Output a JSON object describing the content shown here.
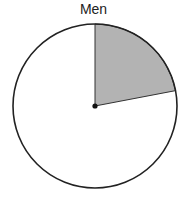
{
  "chart_data": {
    "type": "pie",
    "title": "Men",
    "categories": [
      "Shaded",
      "Unshaded"
    ],
    "values": [
      22,
      78
    ],
    "start_angle_deg": 0,
    "direction": "clockwise",
    "colors": {
      "shaded": "#b3b3b3",
      "unshaded": "#ffffff",
      "outline": "#222222"
    },
    "legend": "none",
    "center_dot": true
  }
}
